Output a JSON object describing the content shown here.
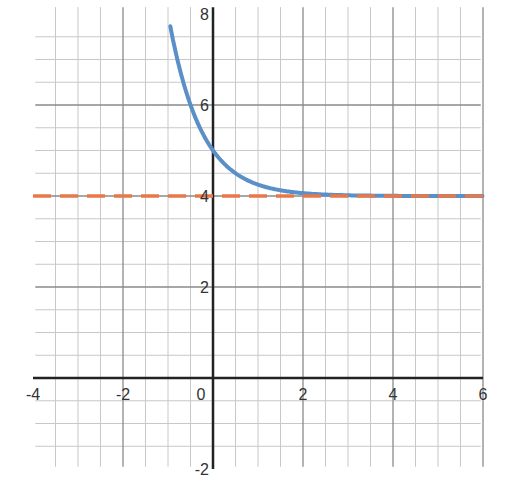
{
  "chart_data": {
    "type": "line",
    "title": "",
    "xlabel": "",
    "ylabel": "",
    "xlim": [
      -4,
      6
    ],
    "ylim": [
      -2,
      8
    ],
    "grid": true,
    "minor_grid_step": 0.5,
    "major_grid_step": 2,
    "x_ticks": [
      -4,
      -2,
      0,
      2,
      4,
      6
    ],
    "x_tick_labels": [
      "-4",
      "-2",
      "0",
      "2",
      "4",
      "6"
    ],
    "y_ticks": [
      -2,
      2,
      4,
      6,
      8
    ],
    "y_tick_labels": [
      "-2",
      "2",
      "4",
      "6",
      "8"
    ],
    "series": [
      {
        "name": "exponential curve",
        "style": "solid",
        "color": "#5b8fc7",
        "equation": "y = (1/4)^x + 4",
        "x": [
          -0.95,
          -0.75,
          -0.5,
          -0.25,
          0,
          0.25,
          0.5,
          0.75,
          1,
          1.5,
          2,
          2.5,
          3,
          4,
          5,
          6
        ],
        "y": [
          7.73,
          6.83,
          6.0,
          5.41,
          5.0,
          4.71,
          4.5,
          4.35,
          4.25,
          4.13,
          4.06,
          4.03,
          4.02,
          4.0,
          4.0,
          4.0
        ]
      },
      {
        "name": "horizontal asymptote",
        "style": "dashed",
        "color": "#e8784a",
        "equation": "y = 4",
        "x": [
          -4,
          6
        ],
        "y": [
          4,
          4
        ]
      }
    ]
  },
  "colors": {
    "grid": "#c8c8c8",
    "major_grid": "#8a8a8a",
    "axis": "#222222"
  }
}
